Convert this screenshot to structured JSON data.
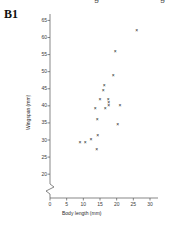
{
  "panel": {
    "label": "B1"
  },
  "top_cut_text": {
    "left": "g",
    "right": "g"
  },
  "chart_data": {
    "type": "scatter",
    "title": "",
    "xlabel": "Body length (mm)",
    "ylabel": "Wingspan (mm)",
    "xlim": [
      0,
      30
    ],
    "ylim": [
      18,
      66
    ],
    "xticks": [
      0,
      5,
      10,
      15,
      20,
      25,
      30
    ],
    "yticks": [
      20,
      25,
      30,
      35,
      40,
      45,
      50,
      55,
      60,
      65
    ],
    "grid": false,
    "legend": false,
    "axis_break": {
      "axis": "y",
      "below": 20,
      "note": "broken y-axis between 0 and 20"
    },
    "marker": "x",
    "marker_color": "#111111",
    "points": [
      {
        "x": 9.0,
        "y": 29.3
      },
      {
        "x": 10.6,
        "y": 29.3
      },
      {
        "x": 12.3,
        "y": 30.2
      },
      {
        "x": 14.0,
        "y": 27.2
      },
      {
        "x": 14.3,
        "y": 31.2
      },
      {
        "x": 14.2,
        "y": 36.1
      },
      {
        "x": 13.6,
        "y": 39.2
      },
      {
        "x": 15.0,
        "y": 42.0
      },
      {
        "x": 16.0,
        "y": 44.6
      },
      {
        "x": 16.3,
        "y": 46.0
      },
      {
        "x": 16.6,
        "y": 39.2
      },
      {
        "x": 17.5,
        "y": 41.9
      },
      {
        "x": 17.6,
        "y": 41.0
      },
      {
        "x": 17.6,
        "y": 40.2
      },
      {
        "x": 19.0,
        "y": 49.0
      },
      {
        "x": 19.6,
        "y": 56.0
      },
      {
        "x": 20.3,
        "y": 34.5
      },
      {
        "x": 21.0,
        "y": 40.2
      },
      {
        "x": 26.0,
        "y": 62.0
      }
    ]
  }
}
